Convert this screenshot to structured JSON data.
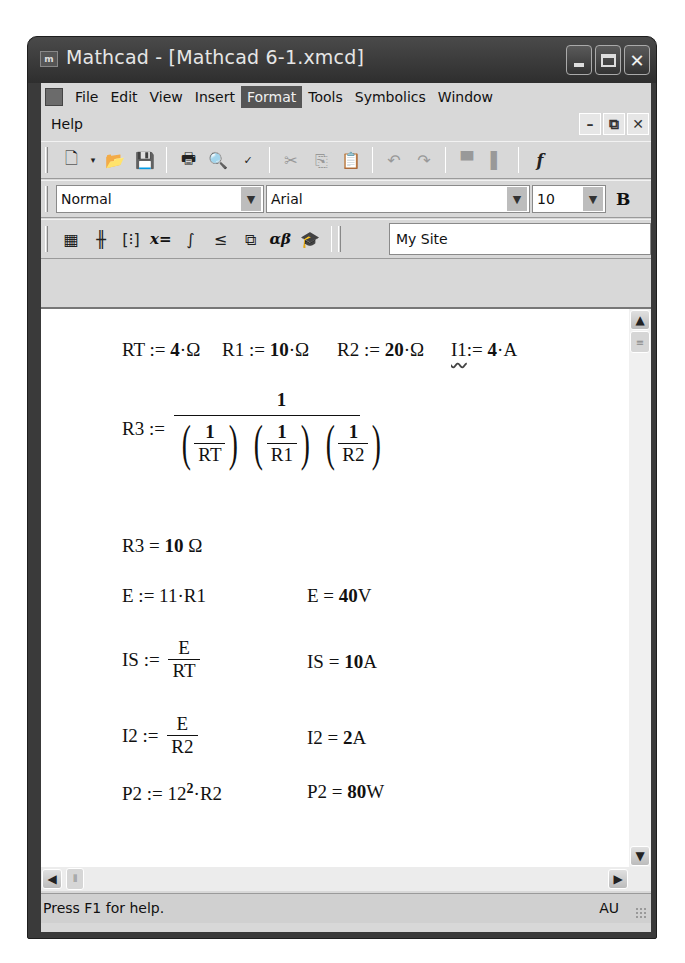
{
  "window": {
    "title": "Mathcad - [Mathcad 6-1.xmcd]",
    "controls": [
      "minimize",
      "maximize",
      "close"
    ]
  },
  "menubar": {
    "items": [
      {
        "label": "File",
        "active": false
      },
      {
        "label": "Edit",
        "active": false
      },
      {
        "label": "View",
        "active": false
      },
      {
        "label": "Insert",
        "active": false
      },
      {
        "label": "Format",
        "active": true
      },
      {
        "label": "Tools",
        "active": false
      },
      {
        "label": "Symbolics",
        "active": false
      },
      {
        "label": "Window",
        "active": false
      }
    ],
    "help_label": "Help",
    "mdi_controls": [
      "minimize",
      "restore",
      "close"
    ]
  },
  "standard_toolbar": {
    "icons": [
      "new-document",
      "dropdown",
      "open-folder",
      "save",
      "print",
      "print-preview",
      "spell-check",
      "cut",
      "copy",
      "paste",
      "undo",
      "redo",
      "align-top",
      "align-down",
      "function"
    ]
  },
  "format_toolbar": {
    "style_value": "Normal",
    "font_value": "Arial",
    "size_value": "10",
    "bold_label": "B"
  },
  "math_toolbar": {
    "icons": [
      "calculator",
      "graph",
      "matrix",
      "evaluation",
      "calculus",
      "boolean",
      "programming",
      "greek",
      "symbolic"
    ],
    "labels": {
      "evaluation": "x=",
      "greek": "αβ"
    },
    "resource_value": "My Site"
  },
  "worksheet": {
    "line1": {
      "rt": {
        "name": "RT",
        "op": ":=",
        "value": "4",
        "unit": "Ω"
      },
      "r1": {
        "name": "R1",
        "op": ":=",
        "value": "10",
        "unit": "Ω"
      },
      "r2": {
        "name": "R2",
        "op": ":=",
        "value": "20",
        "unit": "Ω"
      },
      "i1": {
        "name": "I1",
        "op": ":=",
        "value": "4",
        "unit": "A"
      }
    },
    "r3_def": {
      "name": "R3",
      "op": ":=",
      "numerator": "1",
      "terms": [
        {
          "num": "1",
          "den": "RT"
        },
        {
          "num": "1",
          "den": "R1"
        },
        {
          "num": "1",
          "den": "R2"
        }
      ]
    },
    "r3_result": {
      "name": "R3",
      "op": "=",
      "value": "10",
      "unit": "Ω"
    },
    "e_def": {
      "lhs": "E",
      "op": ":=",
      "rhs": "11·R1"
    },
    "e_result": {
      "name": "E",
      "op": "=",
      "value": "40",
      "unit": "V"
    },
    "is_def": {
      "lhs": "IS",
      "op": ":=",
      "num": "E",
      "den": "RT"
    },
    "is_result": {
      "name": "IS",
      "op": "=",
      "value": "10",
      "unit": "A"
    },
    "i2_def": {
      "lhs": "I2",
      "op": ":=",
      "num": "E",
      "den": "R2"
    },
    "i2_result": {
      "name": "I2",
      "op": "=",
      "value": "2",
      "unit": "A"
    },
    "p2_def": {
      "lhs": "P2",
      "op": ":=",
      "base": "12",
      "exp": "2",
      "rest": "·R2"
    },
    "p2_result": {
      "name": "P2",
      "op": "=",
      "value": "80",
      "unit": "W"
    }
  },
  "statusbar": {
    "help_text": "Press F1 for help.",
    "mode": "AU"
  }
}
